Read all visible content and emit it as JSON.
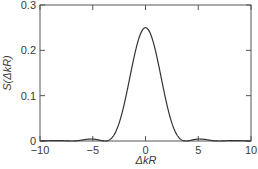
{
  "chart_data": {
    "type": "line",
    "title": "",
    "xlabel": "ΔkR",
    "ylabel": "S(ΔkR)",
    "xlim": [
      -10,
      10
    ],
    "ylim": [
      0,
      0.3
    ],
    "xticks": [
      -10,
      -5,
      0,
      5,
      10
    ],
    "xtick_labels": [
      "−10",
      "−5",
      "0",
      "5",
      "10"
    ],
    "yticks": [
      0,
      0.1,
      0.2,
      0.3
    ],
    "ytick_labels": [
      "0",
      "0.1",
      "0.2",
      "0.3"
    ],
    "grid": false,
    "legend": null,
    "series": [
      {
        "name": "S(ΔkR)",
        "color": "#333333",
        "x": [
          -10,
          -9,
          -8.4,
          -8,
          -7,
          -6,
          -5.1,
          -4.5,
          -3.83,
          -3.5,
          -3,
          -2.5,
          -2,
          -1.5,
          -1,
          -0.5,
          0,
          0.5,
          1,
          1.5,
          2,
          2.5,
          3,
          3.5,
          3.83,
          4.5,
          5.1,
          6,
          7,
          8,
          8.4,
          9,
          10
        ],
        "y": [
          0.0002,
          0.0002,
          0.0008,
          0.0006,
          0.0,
          0.0013,
          0.0044,
          0.0024,
          0.0,
          0.0026,
          0.0119,
          0.0324,
          0.0668,
          0.1098,
          0.1936,
          0.2346,
          0.25,
          0.2346,
          0.1936,
          0.1098,
          0.0668,
          0.0324,
          0.0119,
          0.0026,
          0.0,
          0.0024,
          0.0044,
          0.0013,
          0.0,
          0.0006,
          0.0008,
          0.0002,
          0.0002
        ]
      }
    ]
  }
}
